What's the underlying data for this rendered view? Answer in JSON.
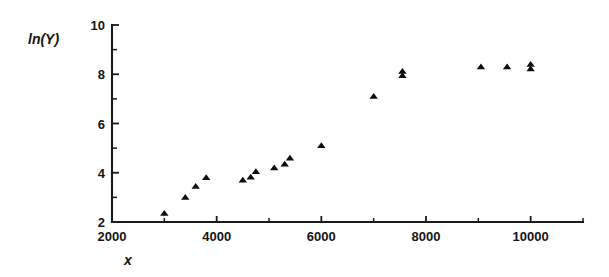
{
  "chart_data": {
    "type": "scatter",
    "title": "",
    "xlabel": "x",
    "ylabel": "ln(Y)",
    "xlim": [
      2000,
      11000
    ],
    "ylim": [
      2,
      10
    ],
    "grid": false,
    "legend": null,
    "marker": "filled-triangle",
    "marker_color": "#0d0d0d",
    "x_ticks_major": [
      2000,
      4000,
      6000,
      8000,
      10000
    ],
    "x_tick_labels": [
      "2000",
      "4000",
      "6000",
      "8000",
      "10000"
    ],
    "x_ticks_minor": [
      3000,
      5000,
      7000,
      9000,
      11000
    ],
    "y_ticks_major": [
      2,
      4,
      6,
      8,
      10
    ],
    "y_tick_labels": [
      "2",
      "4",
      "6",
      "8",
      "10"
    ],
    "y_ticks_minor": [
      3,
      5,
      7,
      9
    ],
    "points": [
      {
        "x": 3000,
        "y": 2.35
      },
      {
        "x": 3400,
        "y": 3.0
      },
      {
        "x": 3600,
        "y": 3.45
      },
      {
        "x": 3800,
        "y": 3.8
      },
      {
        "x": 4500,
        "y": 3.7
      },
      {
        "x": 4650,
        "y": 3.82
      },
      {
        "x": 4750,
        "y": 4.05
      },
      {
        "x": 5100,
        "y": 4.2
      },
      {
        "x": 5300,
        "y": 4.35
      },
      {
        "x": 5400,
        "y": 4.6
      },
      {
        "x": 6000,
        "y": 5.1
      },
      {
        "x": 7000,
        "y": 7.1
      },
      {
        "x": 7550,
        "y": 7.95
      },
      {
        "x": 7550,
        "y": 8.12
      },
      {
        "x": 9050,
        "y": 8.3
      },
      {
        "x": 9550,
        "y": 8.3
      },
      {
        "x": 10000,
        "y": 8.22
      },
      {
        "x": 10000,
        "y": 8.4
      }
    ]
  },
  "axes": {
    "y_label_text": "ln(Y)",
    "x_label_text": "x"
  }
}
